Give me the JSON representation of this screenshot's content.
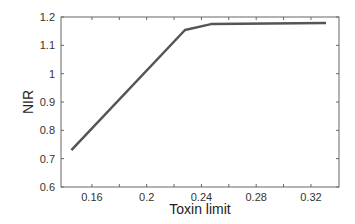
{
  "chart_data": {
    "type": "line",
    "title": "",
    "xlabel": "Toxin limit",
    "ylabel": "NIR",
    "xlim": [
      0.1374,
      0.3405
    ],
    "ylim": [
      0.6,
      1.2
    ],
    "xticks": [
      0.16,
      0.2,
      0.24,
      0.28,
      0.32
    ],
    "xtick_labels": [
      "0.16",
      "0.2",
      "0.24",
      "0.28",
      "0.32"
    ],
    "xminor": [
      0.18,
      0.22,
      0.26,
      0.3
    ],
    "yticks": [
      0.6,
      0.7,
      0.8,
      0.9,
      1.0,
      1.1,
      1.2
    ],
    "ytick_labels": [
      "0.6",
      "0.7",
      "0.8",
      "0.9",
      "1",
      "1.1",
      "1.2"
    ],
    "grid": false,
    "legend": null,
    "series": [
      {
        "name": "NIR",
        "color": "#555555",
        "x": [
          0.145,
          0.228,
          0.247,
          0.331
        ],
        "y": [
          0.73,
          1.154,
          1.175,
          1.179
        ]
      }
    ]
  }
}
